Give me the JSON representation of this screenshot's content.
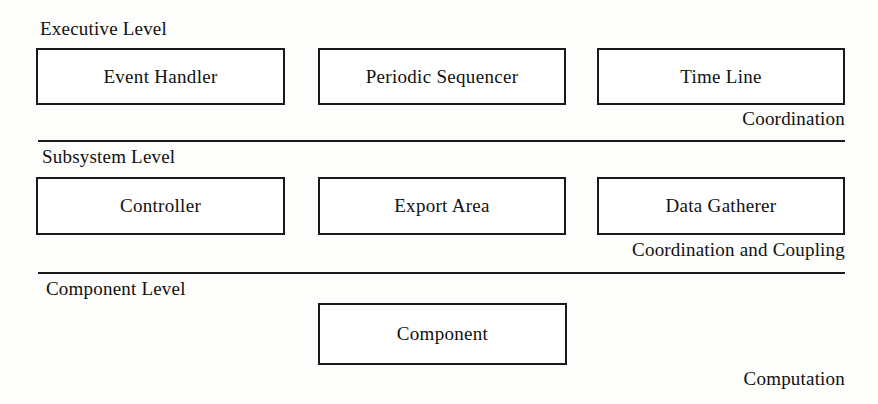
{
  "diagram": {
    "tiers": [
      {
        "id": "executive",
        "label": "Executive Level",
        "side_label": "Coordination",
        "boxes": [
          {
            "label": "Event Handler"
          },
          {
            "label": "Periodic Sequencer"
          },
          {
            "label": "Time Line"
          }
        ]
      },
      {
        "id": "subsystem",
        "label": "Subsystem Level",
        "side_label": "Coordination and Coupling",
        "boxes": [
          {
            "label": "Controller"
          },
          {
            "label": "Export Area"
          },
          {
            "label": "Data Gatherer"
          }
        ]
      },
      {
        "id": "component",
        "label": "Component Level",
        "side_label": "Computation",
        "boxes": [
          {
            "label": "Component"
          }
        ]
      }
    ],
    "colors": {
      "line": "#1a1a1a",
      "text": "#111111",
      "background": "#fdfdfc",
      "box_fill": "#ffffff"
    }
  }
}
